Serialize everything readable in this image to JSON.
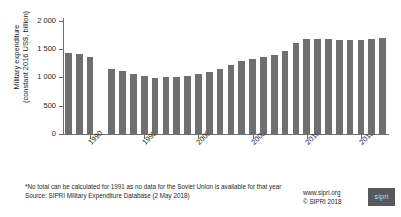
{
  "chart_data": {
    "type": "bar",
    "title": "",
    "xlabel": "",
    "ylabel": "Military expenditure (constant 2016 US$, billion)",
    "ylabel_line1": "Military expenditure",
    "ylabel_line2": "(constant 2016 US$, billion)",
    "ylim": [
      0,
      2000
    ],
    "ytick_values": [
      0,
      500,
      1000,
      1500,
      2000
    ],
    "ytick_labels": [
      "0",
      "500",
      "1 000",
      "1 500",
      "2 000"
    ],
    "xtick_labels": [
      "1990",
      "1995",
      "2000",
      "2005",
      "2010",
      "2015"
    ],
    "xtick_categories": [
      "1990",
      "1995",
      "2000",
      "2005",
      "2010",
      "2015"
    ],
    "grid": false,
    "legend": "none",
    "bar_color": "#6e6f71",
    "axis_color": "#6d6e71",
    "categories": [
      "1988",
      "1989",
      "1990",
      "1991",
      "1992",
      "1993",
      "1994",
      "1995",
      "1996",
      "1997",
      "1998",
      "1999",
      "2000",
      "2001",
      "2002",
      "2003",
      "2004",
      "2005",
      "2006",
      "2007",
      "2008",
      "2009",
      "2010",
      "2011",
      "2012",
      "2013",
      "2014",
      "2015",
      "2016",
      "2017"
    ],
    "values": [
      1432,
      1412,
      1358,
      null,
      1148,
      1108,
      1065,
      1017,
      997,
      1008,
      1004,
      1027,
      1060,
      1090,
      1153,
      1217,
      1283,
      1322,
      1359,
      1400,
      1470,
      1600,
      1673,
      1677,
      1675,
      1660,
      1668,
      1665,
      1682,
      1693
    ],
    "missing_category": "1991",
    "missing_note": "1991 excluded: no data for the Soviet Union"
  },
  "footer": {
    "footnote": "*No total can be calculated for 1991 as no data for the Soviet Union is available for that year",
    "source": "Source: SIPRI Military Expenditure Database (2 May 2018)"
  },
  "credit": {
    "website": "www.sipri.org",
    "copyright": "© SIPRI 2018",
    "logo_text": "sipri"
  }
}
